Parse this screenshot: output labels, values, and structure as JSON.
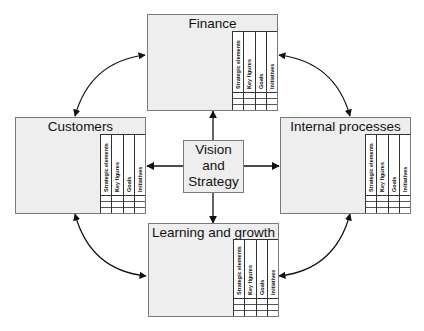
{
  "center": {
    "lines": [
      "Vision",
      "and",
      "Strategy"
    ]
  },
  "perspectives": {
    "finance": {
      "title": "Finance"
    },
    "customers": {
      "title": "Customers"
    },
    "internal": {
      "title": "Internal processes"
    },
    "learning": {
      "title": "Learning and growth"
    }
  },
  "table_columns": [
    "Strategic elements",
    "Key figures",
    "Goals",
    "Initiatives"
  ],
  "colors": {
    "box_fill": "#eeeeee",
    "border": "#7a7a7a",
    "arrow": "#111111"
  }
}
